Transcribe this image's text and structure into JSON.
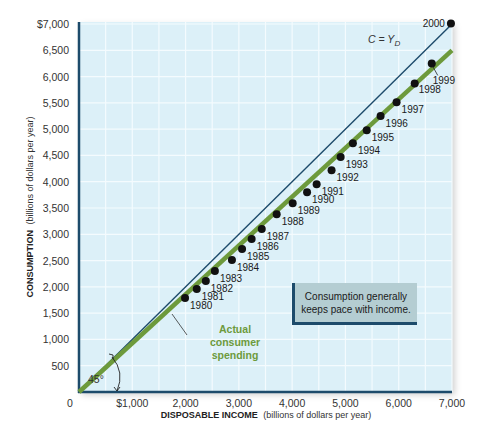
{
  "chart_data": {
    "type": "scatter",
    "title": "",
    "xlabel_bold": "DISPOSABLE INCOME",
    "xlabel_rest": "(billions of dollars per year)",
    "ylabel_bold": "CONSUMPTION",
    "ylabel_rest": "(billions of dollars per year)",
    "xlim": [
      0,
      7000
    ],
    "ylim": [
      0,
      7000
    ],
    "grid": true,
    "x_ticks": [
      "0",
      "$1,000",
      "2,000",
      "3,000",
      "4,000",
      "5,000",
      "6,000",
      "7,000"
    ],
    "y_ticks": [
      "500",
      "1,000",
      "1,500",
      "2,000",
      "2,500",
      "3,000",
      "3,500",
      "4,000",
      "4,500",
      "5,000",
      "5,500",
      "6,000",
      "6,500",
      "$7,000"
    ],
    "series": [
      {
        "name": "Actual consumer spending (annual data points)",
        "points": [
          {
            "year": "1980",
            "x": 1990,
            "y": 1790
          },
          {
            "year": "1981",
            "x": 2210,
            "y": 1960
          },
          {
            "year": "1982",
            "x": 2380,
            "y": 2110
          },
          {
            "year": "1983",
            "x": 2550,
            "y": 2300
          },
          {
            "year": "1984",
            "x": 2870,
            "y": 2510
          },
          {
            "year": "1985",
            "x": 3060,
            "y": 2720
          },
          {
            "year": "1986",
            "x": 3240,
            "y": 2910
          },
          {
            "year": "1987",
            "x": 3430,
            "y": 3100
          },
          {
            "year": "1988",
            "x": 3710,
            "y": 3380
          },
          {
            "year": "1989",
            "x": 4010,
            "y": 3590
          },
          {
            "year": "1990",
            "x": 4280,
            "y": 3800
          },
          {
            "year": "1991",
            "x": 4460,
            "y": 3950
          },
          {
            "year": "1992",
            "x": 4740,
            "y": 4220
          },
          {
            "year": "1993",
            "x": 4910,
            "y": 4470
          },
          {
            "year": "1994",
            "x": 5140,
            "y": 4730
          },
          {
            "year": "1995",
            "x": 5400,
            "y": 4980
          },
          {
            "year": "1996",
            "x": 5660,
            "y": 5250
          },
          {
            "year": "1997",
            "x": 5960,
            "y": 5510
          },
          {
            "year": "1998",
            "x": 6300,
            "y": 5870
          },
          {
            "year": "1999",
            "x": 6620,
            "y": 6250
          },
          {
            "year": "2000",
            "x": 6980,
            "y": 7010
          }
        ]
      },
      {
        "name": "C = YD (45-degree line)",
        "type": "line",
        "x": [
          0,
          7000
        ],
        "y": [
          0,
          7000
        ]
      },
      {
        "name": "Actual consumer spending (trend line)",
        "type": "line",
        "x": [
          0,
          7000
        ],
        "y": [
          0,
          6500
        ]
      }
    ],
    "annotations": {
      "line_label": "C = Y",
      "line_label_sub": "D",
      "angle_label": "45°",
      "green_label": [
        "Actual",
        "consumer",
        "spending"
      ],
      "note": [
        "Consumption generally",
        "keeps pace with income."
      ]
    },
    "colors": {
      "plot_bg": "#dcf0f8",
      "grid": "#f4fbfe",
      "axis": "#1d4b6b",
      "diagonal": "#1d4b6b",
      "trend": "#6d9a3c",
      "dot": "#111111"
    }
  }
}
